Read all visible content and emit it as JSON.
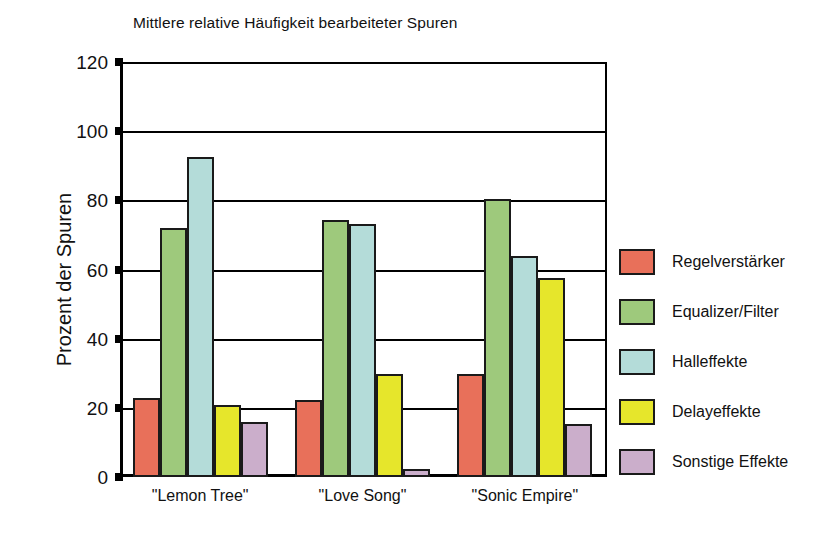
{
  "chart_data": {
    "type": "bar",
    "title": "Mittlere relative Häufigkeit bearbeiteter Spuren",
    "xlabel": "",
    "ylabel": "Prozent der Spuren",
    "ylim": [
      0,
      120
    ],
    "yticks": [
      0,
      20,
      40,
      60,
      80,
      100,
      120
    ],
    "ytick_labels": [
      "0",
      "20",
      "40",
      "60",
      "80",
      "100",
      "120"
    ],
    "grid": true,
    "legend_position": "right",
    "categories": [
      "\"Lemon Tree\"",
      "\"Love Song\"",
      "\"Sonic Empire\""
    ],
    "series": [
      {
        "name": "Regelverstärker",
        "color": "#e8705a",
        "values": [
          22.8,
          22.4,
          29.8
        ]
      },
      {
        "name": "Equalizer/Filter",
        "color": "#9ec97c",
        "values": [
          72.0,
          74.2,
          80.3
        ]
      },
      {
        "name": "Halleffekte",
        "color": "#b4dcd9",
        "values": [
          92.4,
          73.2,
          64.0
        ]
      },
      {
        "name": "Delayeffekte",
        "color": "#e6e62b",
        "values": [
          20.8,
          29.9,
          57.5
        ]
      },
      {
        "name": "Sonstige Effekte",
        "color": "#cbaecb",
        "values": [
          15.9,
          2.2,
          15.2
        ]
      }
    ]
  },
  "legend": {
    "items": [
      {
        "label": "Regelverstärker",
        "color": "#e8705a"
      },
      {
        "label": "Equalizer/Filter",
        "color": "#9ec97c"
      },
      {
        "label": "Halleffekte",
        "color": "#b4dcd9"
      },
      {
        "label": "Delayeffekte",
        "color": "#e6e62b"
      },
      {
        "label": "Sonstige Effekte",
        "color": "#cbaecb"
      }
    ]
  },
  "colors": {
    "axis": "#000000",
    "bar_outline": "#1a1a1a",
    "background": "#ffffff",
    "text": "#111111"
  }
}
